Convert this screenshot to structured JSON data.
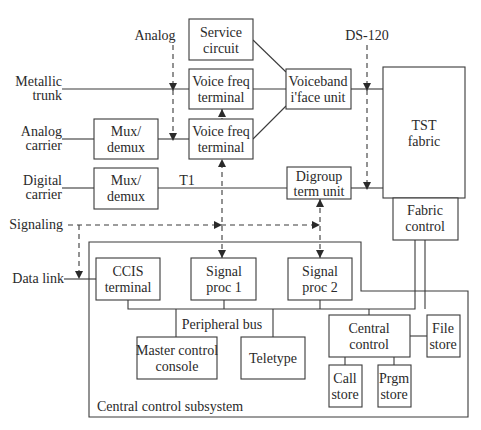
{
  "diagram": {
    "inputs": {
      "analog": "Analog",
      "ds120": "DS-120",
      "metallic_trunk": [
        "Metallic",
        "trunk"
      ],
      "analog_carrier": [
        "Analog",
        "carrier"
      ],
      "digital_carrier": [
        "Digital",
        "carrier"
      ],
      "signaling": "Signaling",
      "data_link": "Data link",
      "t1": "T1"
    },
    "boxes": {
      "service_circuit": [
        "Service",
        "circuit"
      ],
      "voice_freq_terminal_1": [
        "Voice freq",
        "terminal"
      ],
      "voice_freq_terminal_2": [
        "Voice freq",
        "terminal"
      ],
      "voiceband_iface_unit": [
        "Voiceband",
        "i'face unit"
      ],
      "tst_fabric": [
        "TST",
        "fabric"
      ],
      "fabric_control": [
        "Fabric",
        "control"
      ],
      "mux_demux_1": [
        "Mux/",
        "demux"
      ],
      "mux_demux_2": [
        "Mux/",
        "demux"
      ],
      "digroup_term_unit": [
        "Digroup",
        "term unit"
      ],
      "ccis_terminal": [
        "CCIS",
        "terminal"
      ],
      "signal_proc_1": [
        "Signal",
        "proc 1"
      ],
      "signal_proc_2": [
        "Signal",
        "proc 2"
      ],
      "master_control_console": [
        "Master control",
        "console"
      ],
      "teletype": [
        "Teletype"
      ],
      "central_control": [
        "Central",
        "control"
      ],
      "file_store": [
        "File",
        "store"
      ],
      "call_store": [
        "Call",
        "store"
      ],
      "prgm_store": [
        "Prgm",
        "store"
      ]
    },
    "labels": {
      "peripheral_bus": "Peripheral bus",
      "central_control_subsystem": "Central control subsystem"
    }
  }
}
